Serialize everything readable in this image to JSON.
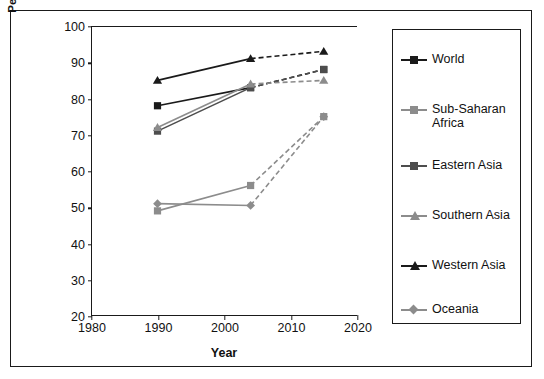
{
  "chart_data": {
    "type": "line",
    "title": "",
    "xlabel": "Year",
    "ylabel": "Percent of population with access to drinking water",
    "ylabel_line1": "Percent of population with access to",
    "ylabel_line2": "drinking water",
    "xlim": [
      1980,
      2020
    ],
    "ylim": [
      20,
      100
    ],
    "xticks": [
      1980,
      1990,
      2000,
      2010,
      2020
    ],
    "yticks": [
      20,
      30,
      40,
      50,
      60,
      70,
      80,
      90,
      100
    ],
    "grid": false,
    "legend_position": "right",
    "x": [
      1990,
      2004,
      2015
    ],
    "note": "Segment 1990-2004 solid (observed); segment 2004-2015 dashed (projected)",
    "series": [
      {
        "name": "World",
        "marker": "square",
        "color": "#1a1a1a",
        "values": [
          78,
          83,
          88
        ]
      },
      {
        "name": "Sub-Saharan Africa",
        "marker": "square",
        "color": "#8c8c8c",
        "values": [
          49,
          56,
          75
        ]
      },
      {
        "name": "Eastern Asia",
        "marker": "square",
        "color": "#4d4d4d",
        "values": [
          71,
          83,
          88
        ]
      },
      {
        "name": "Southern Asia",
        "marker": "triangle",
        "color": "#8c8c8c",
        "values": [
          72,
          84,
          85
        ]
      },
      {
        "name": "Western Asia",
        "marker": "triangle",
        "color": "#1a1a1a",
        "values": [
          85,
          91,
          93
        ]
      },
      {
        "name": "Oceania",
        "marker": "diamond",
        "color": "#8c8c8c",
        "values": [
          51,
          50.5,
          75
        ]
      }
    ]
  },
  "legend": {
    "items": [
      {
        "label": "World"
      },
      {
        "label": "Sub-Saharan\nAfrica",
        "label_l1": "Sub-Saharan",
        "label_l2": "Africa"
      },
      {
        "label": "Eastern Asia"
      },
      {
        "label": "Southern Asia"
      },
      {
        "label": "Western Asia"
      },
      {
        "label": "Oceania"
      }
    ]
  }
}
